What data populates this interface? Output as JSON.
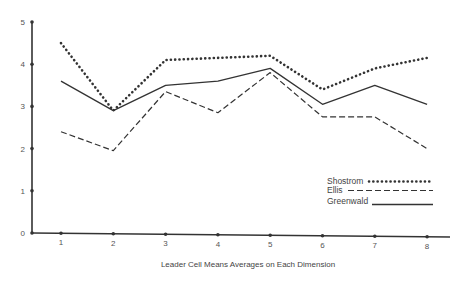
{
  "chart_data": {
    "type": "line",
    "title": "",
    "xlabel": "Leader Cell Means Averages on Each Dimension",
    "ylabel": "",
    "x": [
      1,
      2,
      3,
      4,
      5,
      6,
      7,
      8
    ],
    "xticks": [
      "1",
      "2",
      "3",
      "4",
      "5",
      "6",
      "7",
      "8"
    ],
    "yticks": [
      "0",
      "1",
      "2",
      "3",
      "4",
      "5"
    ],
    "ylim": [
      0,
      5
    ],
    "grid": false,
    "legend_position": "right-lower",
    "series": [
      {
        "name": "Shostrom",
        "style": "dotted",
        "values": [
          4.5,
          2.9,
          4.1,
          4.15,
          4.2,
          3.4,
          3.9,
          4.15
        ]
      },
      {
        "name": "Ellis",
        "style": "dashed",
        "values": [
          2.4,
          1.95,
          3.35,
          2.85,
          3.8,
          2.75,
          2.75,
          2.0
        ]
      },
      {
        "name": "Greenwald",
        "style": "solid",
        "values": [
          3.6,
          2.9,
          3.5,
          3.6,
          3.9,
          3.05,
          3.5,
          3.05
        ]
      }
    ]
  },
  "legend": {
    "items": [
      "Shostrom",
      "Ellis",
      "Greenwald"
    ]
  },
  "colors": {
    "line": "#333333",
    "axis": "#333333"
  }
}
